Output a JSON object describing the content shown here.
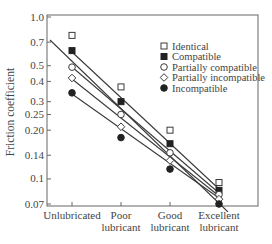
{
  "chart_data": {
    "type": "scatter",
    "title": "",
    "xlabel": "",
    "ylabel": "Friction coefficient",
    "yscale": "log",
    "ylim": [
      0.07,
      1.0
    ],
    "yticks": [
      "1.0",
      "0.7",
      "0.5",
      "0.4",
      "0.3",
      "0.25",
      "0.20",
      "0.14",
      "0.1",
      "0.07"
    ],
    "ytick_values": [
      1.0,
      0.7,
      0.5,
      0.4,
      0.3,
      0.25,
      0.2,
      0.14,
      0.1,
      0.07
    ],
    "categories": [
      [
        "Unlubricated"
      ],
      [
        "Poor",
        "lubricant"
      ],
      [
        "Good",
        "lubricant"
      ],
      [
        "Excellent",
        "lubricant"
      ]
    ],
    "legend_position": "upper right (inside)",
    "grid": false,
    "series": [
      {
        "name": "Identical",
        "marker": "square-open",
        "values": [
          0.77,
          0.37,
          0.2,
          0.095
        ]
      },
      {
        "name": "Compatible",
        "marker": "square-filled",
        "values": [
          0.62,
          0.3,
          0.165,
          0.085
        ]
      },
      {
        "name": "Partially compatible",
        "marker": "circle-open",
        "values": [
          0.49,
          0.25,
          0.145,
          0.08
        ]
      },
      {
        "name": "Partially incompatible",
        "marker": "diamond-open",
        "values": [
          0.42,
          0.21,
          0.13,
          0.075
        ]
      },
      {
        "name": "Incompatible",
        "marker": "circle-filled",
        "values": [
          0.34,
          0.18,
          0.115,
          0.07
        ]
      }
    ],
    "fit_lines": [
      {
        "name": "Identical fit",
        "points": [
          [
            0,
            0.7
          ],
          [
            3,
            0.062
          ]
        ]
      },
      {
        "name": "Compatible fit",
        "points": [
          [
            0,
            0.62
          ],
          [
            3,
            0.082
          ]
        ]
      },
      {
        "name": "Partially compatible fit",
        "points": [
          [
            0,
            0.49
          ],
          [
            3,
            0.078
          ]
        ]
      },
      {
        "name": "Partially incompatible fit",
        "points": [
          [
            0,
            0.42
          ],
          [
            3,
            0.074
          ]
        ]
      },
      {
        "name": "Incompatible fit",
        "points": [
          [
            0,
            0.34
          ],
          [
            3,
            0.07
          ]
        ]
      }
    ]
  }
}
